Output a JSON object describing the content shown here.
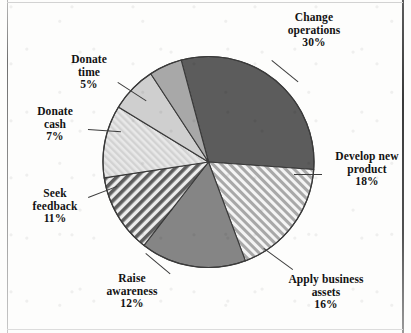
{
  "chart_data": {
    "type": "pie",
    "title": "",
    "subtitle": "",
    "xlabel": "",
    "ylabel": "",
    "legend_position": "none",
    "labels_position": "outside-with-leader-lines",
    "grid": false,
    "units": "percent",
    "total_label": "99%",
    "start_angle_deg": -15,
    "direction": "clockwise",
    "categories": [
      "Change operations",
      "Develop new product",
      "Apply business assets",
      "Raise awareness",
      "Seek feedback",
      "Donate cash",
      "Donate time"
    ],
    "values": [
      30,
      18,
      16,
      12,
      11,
      7,
      5
    ],
    "slices": [
      {
        "name": "Change operations",
        "label_line1": "Change",
        "label_line2": "operations",
        "percent_text": "30%",
        "value": 30,
        "fill": "#5c5c5c",
        "pattern": "solid-dark"
      },
      {
        "name": "Develop new product",
        "label_line1": "Develop new",
        "label_line2": "product",
        "percent_text": "18%",
        "value": 18,
        "fill": "#b4b4b4",
        "pattern": "diagonal-stripes-up-fine"
      },
      {
        "name": "Apply business assets",
        "label_line1": "Apply business",
        "label_line2": "assets",
        "percent_text": "16%",
        "value": 16,
        "fill": "#858585",
        "pattern": "solid-medium"
      },
      {
        "name": "Raise awareness",
        "label_line1": "Raise",
        "label_line2": "awareness",
        "percent_text": "12%",
        "value": 12,
        "fill": "#6f6f6f",
        "pattern": "diagonal-stripes-down-bold"
      },
      {
        "name": "Seek feedback",
        "label_line1": "Seek",
        "label_line2": "feedback",
        "percent_text": "11%",
        "value": 11,
        "fill": "#dcdcdc",
        "pattern": "diagonal-stripes-up-faint"
      },
      {
        "name": "Donate cash",
        "label_line1": "Donate",
        "label_line2": "cash",
        "percent_text": "7%",
        "value": 7,
        "fill": "#cfcfcf",
        "pattern": "solid-light"
      },
      {
        "name": "Donate time",
        "label_line1": "Donate",
        "label_line2": "time",
        "percent_text": "5%",
        "value": 5,
        "fill": "#a8a8a8",
        "pattern": "solid-light-medium"
      }
    ],
    "colors": {
      "outline": "#3a3a3a",
      "background": "#fdfdfc",
      "text": "#131313"
    }
  }
}
